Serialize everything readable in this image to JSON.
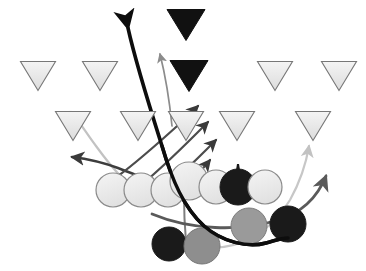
{
  "diagram": {
    "type": "american-football-play",
    "canvas": {
      "width": 366,
      "height": 271,
      "background": "#ffffff"
    },
    "palette": {
      "defender_light_fill": "#ececec",
      "defender_light_stroke": "#777777",
      "defender_dark_fill": "#111111",
      "defender_dark_stroke": "#111111",
      "lineman_light_fill": "#e9e9e9",
      "lineman_light_stroke": "#8a8a8a",
      "player_black_fill": "#1a1a1a",
      "player_gray_fill": "#8e8e8e",
      "player_midgray_fill": "#9a9a9a",
      "route_black": "#0d0d0d",
      "route_dark_gray": "#4c4c4c",
      "route_mid_gray": "#6f6f6f",
      "route_light_gray": "#c2c2c2"
    },
    "legend": {
      "triangle_meaning": "defensive back / linebacker",
      "circle_meaning": "lineman / offensive player",
      "black_fill_meaning": "highlighted player",
      "line_meaning": "player route / motion path"
    },
    "counts": {
      "triangles_total": 17,
      "triangles_black": 2,
      "circles_total": 12,
      "routes_total": 9
    },
    "triangles": [
      {
        "id": "t-top-1",
        "name": "black-triangle-top",
        "cx": 186,
        "cy": 25,
        "w": 38,
        "h": 31,
        "fill": "#111111",
        "stroke": "#111111",
        "row": 0
      },
      {
        "id": "t-r1-1",
        "name": "triangle-row1-1",
        "cx": 38,
        "cy": 76,
        "w": 35,
        "h": 29,
        "fill": "#ececec",
        "stroke": "#777777",
        "row": 1
      },
      {
        "id": "t-r1-2",
        "name": "triangle-row1-2",
        "cx": 100,
        "cy": 76,
        "w": 35,
        "h": 29,
        "fill": "#ececec",
        "stroke": "#777777",
        "row": 1
      },
      {
        "id": "t-r1-3",
        "name": "black-triangle-row1-3",
        "cx": 189,
        "cy": 76,
        "w": 38,
        "h": 31,
        "fill": "#111111",
        "stroke": "#111111",
        "row": 1
      },
      {
        "id": "t-r1-4",
        "name": "triangle-row1-4",
        "cx": 275,
        "cy": 76,
        "w": 35,
        "h": 29,
        "fill": "#ececec",
        "stroke": "#777777",
        "row": 1
      },
      {
        "id": "t-r1-5",
        "name": "triangle-row1-5",
        "cx": 339,
        "cy": 76,
        "w": 35,
        "h": 29,
        "fill": "#ececec",
        "stroke": "#777777",
        "row": 1
      },
      {
        "id": "t-r2-1",
        "name": "triangle-row2-1",
        "cx": 73,
        "cy": 126,
        "w": 35,
        "h": 29,
        "fill": "#ececec",
        "stroke": "#777777",
        "row": 2
      },
      {
        "id": "t-r2-2",
        "name": "triangle-row2-2",
        "cx": 138,
        "cy": 126,
        "w": 35,
        "h": 29,
        "fill": "#ececec",
        "stroke": "#777777",
        "row": 2
      },
      {
        "id": "t-r2-3",
        "name": "triangle-row2-3",
        "cx": 186,
        "cy": 126,
        "w": 35,
        "h": 29,
        "fill": "#ececec",
        "stroke": "#777777",
        "row": 2
      },
      {
        "id": "t-r2-4",
        "name": "triangle-row2-4",
        "cx": 237,
        "cy": 126,
        "w": 35,
        "h": 29,
        "fill": "#ececec",
        "stroke": "#777777",
        "row": 2
      },
      {
        "id": "t-r2-5",
        "name": "triangle-row2-5",
        "cx": 313,
        "cy": 126,
        "w": 35,
        "h": 29,
        "fill": "#ececec",
        "stroke": "#777777",
        "row": 2
      }
    ],
    "circles": [
      {
        "id": "c-1",
        "name": "lineman-1",
        "cx": 113,
        "cy": 190,
        "r": 17,
        "fill": "#ededed",
        "stroke": "#8a8a8a"
      },
      {
        "id": "c-2",
        "name": "lineman-2",
        "cx": 141,
        "cy": 190,
        "r": 17,
        "fill": "#ededed",
        "stroke": "#8a8a8a"
      },
      {
        "id": "c-3",
        "name": "lineman-3",
        "cx": 168,
        "cy": 190,
        "r": 17,
        "fill": "#ededed",
        "stroke": "#8a8a8a"
      },
      {
        "id": "c-4",
        "name": "lineman-4-center",
        "cx": 189,
        "cy": 181,
        "r": 19,
        "fill": "#ededed",
        "stroke": "#8a8a8a"
      },
      {
        "id": "c-5",
        "name": "lineman-5",
        "cx": 216,
        "cy": 187,
        "r": 17,
        "fill": "#ededed",
        "stroke": "#8a8a8a"
      },
      {
        "id": "c-6",
        "name": "player-black-upper",
        "cx": 238,
        "cy": 187,
        "r": 18,
        "fill": "#1a1a1a",
        "stroke": "#1a1a1a"
      },
      {
        "id": "c-7",
        "name": "lineman-7",
        "cx": 265,
        "cy": 187,
        "r": 17,
        "fill": "#ededed",
        "stroke": "#8a8a8a"
      },
      {
        "id": "c-8",
        "name": "player-black-lower-left",
        "cx": 169,
        "cy": 244,
        "r": 17,
        "fill": "#1a1a1a",
        "stroke": "#1a1a1a"
      },
      {
        "id": "c-9",
        "name": "player-gray-lower-left",
        "cx": 202,
        "cy": 246,
        "r": 18,
        "fill": "#8e8e8e",
        "stroke": "#787878"
      },
      {
        "id": "c-10",
        "name": "player-gray-lower-right",
        "cx": 249,
        "cy": 226,
        "r": 18,
        "fill": "#9a9a9a",
        "stroke": "#7d7d7d"
      },
      {
        "id": "c-11",
        "name": "player-black-lower-right",
        "cx": 288,
        "cy": 224,
        "r": 18,
        "fill": "#1a1a1a",
        "stroke": "#1a1a1a"
      }
    ],
    "routes": [
      {
        "id": "r-main-black",
        "name": "route-primary-black-sweep",
        "color": "#0d0d0d",
        "width": 3.6,
        "arrow": "start",
        "description": "thick black route from bottom right sweeping left and up through the line"
      },
      {
        "id": "r-up-gray",
        "name": "route-vertical-gray",
        "color": "#8c8c8c",
        "width": 1.7,
        "arrow": "end",
        "description": "thin gray vertical route up the middle"
      },
      {
        "id": "r-cross-1",
        "name": "route-crossing-1",
        "color": "#4c4c4c",
        "width": 2.2,
        "arrow": "end",
        "description": "diagonal crossing route up and right"
      },
      {
        "id": "r-cross-2",
        "name": "route-crossing-2",
        "color": "#4c4c4c",
        "width": 2.2,
        "arrow": "end",
        "description": "second diagonal crossing route up and right"
      },
      {
        "id": "r-cross-3",
        "name": "route-crossing-3",
        "color": "#4c4c4c",
        "width": 2.2,
        "arrow": "end",
        "description": "third diagonal crossing route up and right"
      },
      {
        "id": "r-cross-4",
        "name": "route-crossing-4",
        "color": "#4c4c4c",
        "width": 2.2,
        "arrow": "end",
        "description": "short diagonal route to upper right"
      },
      {
        "id": "r-left-flat",
        "name": "route-left-flat",
        "color": "#3d3d3d",
        "width": 2.4,
        "arrow": "end",
        "description": "flat route running left with arrow"
      },
      {
        "id": "r-light-arc",
        "name": "route-light-arc-left",
        "color": "#c2c2c2",
        "width": 2.2,
        "arrow": "end",
        "description": "light gray arc curving up and left"
      },
      {
        "id": "r-light-arc-right",
        "name": "route-light-arc-right",
        "color": "#c7c7c7",
        "width": 2.2,
        "arrow": "end",
        "description": "light gray arc curving up on the right side"
      },
      {
        "id": "r-right-out",
        "name": "route-right-out-up",
        "color": "#5a5a5a",
        "width": 2.8,
        "arrow": "end",
        "description": "dark gray route sweeping right then up with arrow"
      },
      {
        "id": "r-drop-gray",
        "name": "route-drop-vertical",
        "color": "#7e7e7e",
        "width": 2.0,
        "arrow": "none",
        "description": "short vertical gray line dropping below the line of scrimmage"
      }
    ]
  }
}
